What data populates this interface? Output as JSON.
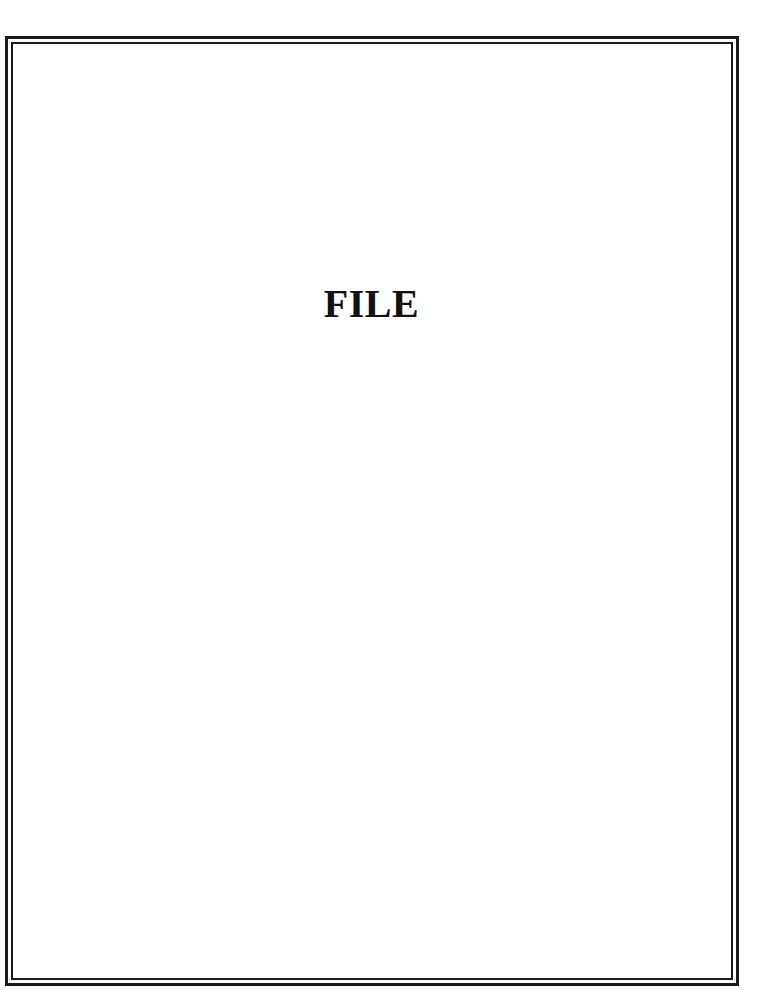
{
  "document": {
    "title": "FILE"
  },
  "colors": {
    "border": "#1a1a1a",
    "text": "#111111",
    "background": "#ffffff"
  }
}
